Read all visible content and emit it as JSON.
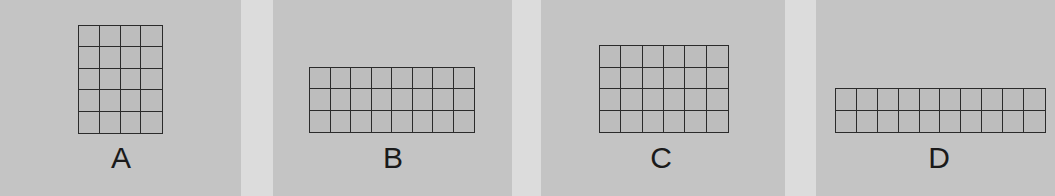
{
  "figure": {
    "panels": [
      {
        "label": "A",
        "columns": 4,
        "rows": 5
      },
      {
        "label": "B",
        "columns": 8,
        "rows": 3
      },
      {
        "label": "C",
        "columns": 6,
        "rows": 4
      },
      {
        "label": "D",
        "columns": 10,
        "rows": 2
      }
    ]
  }
}
